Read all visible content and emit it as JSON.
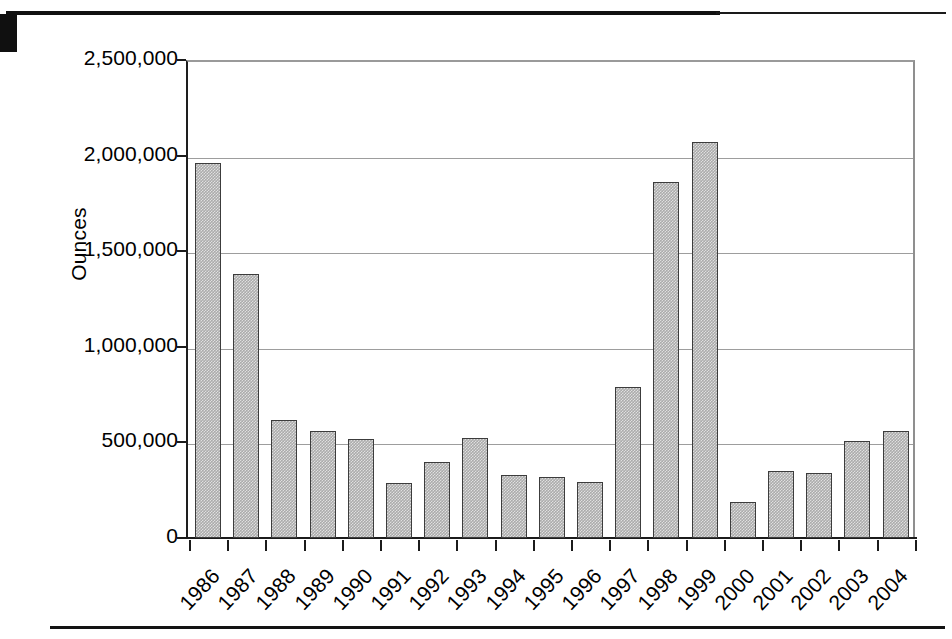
{
  "chart_data": {
    "type": "bar",
    "title": "",
    "subtitle": "",
    "xlabel": "",
    "ylabel": "Ounces",
    "ylim": [
      0,
      2500000
    ],
    "yticks": [
      "0",
      "500,000",
      "1,000,000",
      "1,500,000",
      "2,000,000",
      "2,500,000"
    ],
    "ytick_values": [
      0,
      500000,
      1000000,
      1500000,
      2000000,
      2500000
    ],
    "grid": "horizontal",
    "legend": "none",
    "bar_color": "#ababab",
    "bar_edge_color": "#3c3c3c",
    "gridline_color": "#9d9d9d",
    "axis_color": "#1b1b1b",
    "categories": [
      "1986",
      "1987",
      "1988",
      "1989",
      "1990",
      "1991",
      "1992",
      "1993",
      "1994",
      "1995",
      "1996",
      "1997",
      "1998",
      "1999",
      "2000",
      "2001",
      "2002",
      "2003",
      "2004"
    ],
    "values": [
      1960000,
      1380000,
      615000,
      560000,
      520000,
      290000,
      400000,
      525000,
      330000,
      320000,
      295000,
      790000,
      1860000,
      2070000,
      190000,
      350000,
      340000,
      510000,
      560000
    ],
    "xtick_rotation": -47
  },
  "page": {
    "top_rule": "horizontal-rule",
    "bottom_rule": "horizontal-rule"
  }
}
